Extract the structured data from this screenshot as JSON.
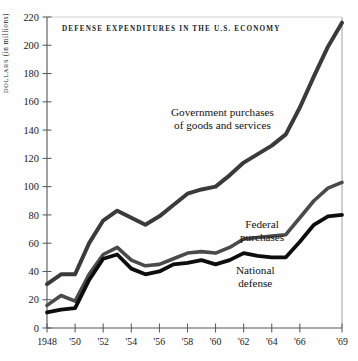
{
  "chart_data": {
    "type": "line",
    "title": "DEFENSE EXPENDITURES IN THE U.S. ECONOMY",
    "xlabel": "",
    "ylabel": "DOLLARS (in millions)",
    "ylabel_smallcaps_part": "DOLLARS",
    "ylabel_rest_part": " (in millions)",
    "xlim": [
      1948,
      1969
    ],
    "ylim": [
      0,
      220
    ],
    "grid": false,
    "legend_position": "inline-annotations",
    "x": [
      1948,
      1949,
      1950,
      1951,
      1952,
      1953,
      1954,
      1955,
      1956,
      1957,
      1958,
      1959,
      1960,
      1961,
      1962,
      1963,
      1964,
      1965,
      1966,
      1967,
      1968,
      1969
    ],
    "xticks": [
      1948,
      1950,
      1952,
      1954,
      1956,
      1958,
      1960,
      1962,
      1964,
      1966,
      1969
    ],
    "xticklabels": [
      "1948",
      "'50",
      "'52",
      "'54",
      "'56",
      "'58",
      "'60",
      "'62",
      "'64",
      "'66",
      "'69"
    ],
    "yticks": [
      0,
      20,
      40,
      60,
      80,
      100,
      120,
      140,
      160,
      180,
      200,
      220
    ],
    "yticklabels": [
      "0",
      "20",
      "40",
      "60",
      "80",
      "100",
      "120",
      "140",
      "160",
      "180",
      "200",
      "220"
    ],
    "series": [
      {
        "name": "Government purchases of goods and services",
        "annotation": "Government purchases\nof goods and services",
        "annotation_line1": "Government purchases",
        "annotation_line2": "of goods and services",
        "color": "#3a3a3a",
        "linewidth": 4.0,
        "values": [
          31,
          38,
          38,
          60,
          76,
          83,
          78,
          73,
          79,
          87,
          95,
          98,
          100,
          108,
          117,
          123,
          129,
          137,
          156,
          178,
          199,
          216
        ]
      },
      {
        "name": "Federal purchases",
        "annotation": "Federal purchases",
        "annotation_line1": "Federal",
        "annotation_line2": "purchases",
        "color": "#4a4a4a",
        "linewidth": 3.6,
        "values": [
          16,
          23,
          19,
          38,
          52,
          57,
          48,
          44,
          45,
          49,
          53,
          54,
          53,
          57,
          63,
          64,
          65,
          66,
          78,
          90,
          99,
          103
        ]
      },
      {
        "name": "National defense",
        "annotation": "National defense",
        "annotation_line1": "National",
        "annotation_line2": "defense",
        "color": "#0d0d0d",
        "linewidth": 3.8,
        "values": [
          11,
          13,
          14,
          34,
          49,
          52,
          42,
          38,
          40,
          45,
          46,
          48,
          45,
          48,
          53,
          51,
          50,
          50,
          61,
          73,
          79,
          80
        ]
      }
    ]
  },
  "figure": {
    "plot_left": 47,
    "plot_right": 342,
    "plot_top": 17,
    "plot_bottom": 328
  }
}
